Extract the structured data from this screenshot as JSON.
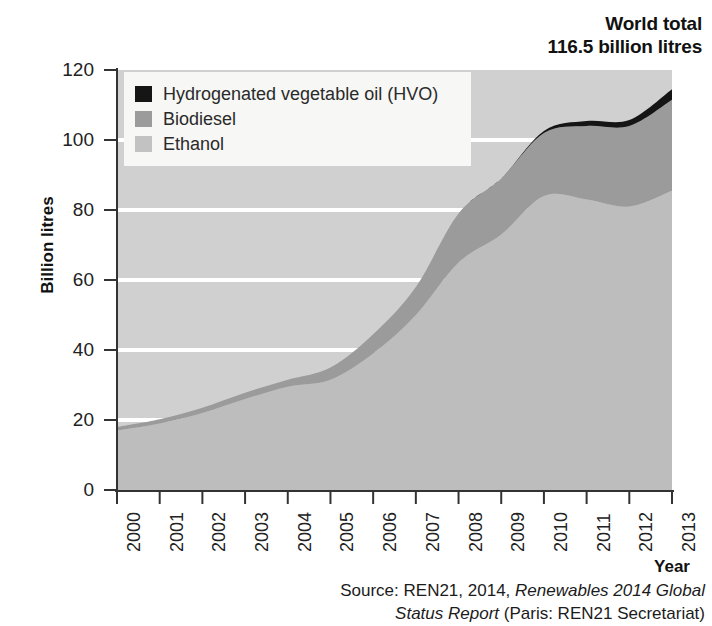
{
  "headline": {
    "line1": "World total",
    "line2": "116.5 billion litres"
  },
  "axes": {
    "y_title": "Billion litres",
    "x_title": "Year",
    "y_ticks": [
      "0",
      "20",
      "40",
      "60",
      "80",
      "100",
      "120"
    ],
    "x_ticks": [
      "2000",
      "2001",
      "2002",
      "2003",
      "2004",
      "2005",
      "2006",
      "2007",
      "2008",
      "2009",
      "2010",
      "2011",
      "2012",
      "2013"
    ]
  },
  "legend": {
    "entries": [
      {
        "label": "Hydrogenated vegetable oil (HVO)",
        "color": "#151515"
      },
      {
        "label": "Biodiesel",
        "color": "#9b9b9b"
      },
      {
        "label": "Ethanol",
        "color": "#c2c2c2"
      }
    ]
  },
  "source": {
    "prefix": "Source: REN21, 2014, ",
    "italic1": "Renewables 2014 Global",
    "italic2": "Status Report",
    "suffix": " (Paris: REN21 Secretariat)"
  },
  "colors": {
    "ethanol": "#bdbdbd",
    "biodiesel": "#9b9b9b",
    "hvo": "#151515",
    "plot_background": "#d0d0d0",
    "gridline": "#ffffff",
    "axis": "#333333"
  },
  "chart_data": {
    "type": "area",
    "stacked": true,
    "title": "World total 116.5 billion litres",
    "xlabel": "Year",
    "ylabel": "Billion litres",
    "ylim": [
      0,
      120
    ],
    "grid": true,
    "legend_position": "inside-top-left",
    "x": [
      "2000",
      "2001",
      "2002",
      "2003",
      "2004",
      "2005",
      "2006",
      "2007",
      "2008",
      "2009",
      "2010",
      "2011",
      "2012",
      "2013"
    ],
    "categories": [
      "2000",
      "2001",
      "2002",
      "2003",
      "2004",
      "2005",
      "2006",
      "2007",
      "2008",
      "2009",
      "2010",
      "2011",
      "2012",
      "2013"
    ],
    "series": [
      {
        "name": "Ethanol",
        "color": "#bdbdbd",
        "values": [
          17.0,
          19.0,
          22.0,
          26.0,
          29.5,
          31.5,
          39.0,
          50.0,
          65.0,
          73.0,
          84.0,
          83.0,
          81.0,
          85.5
        ]
      },
      {
        "name": "Biodiesel",
        "color": "#9b9b9b",
        "values": [
          1.0,
          1.2,
          1.5,
          1.8,
          2.0,
          3.5,
          5.5,
          8.0,
          14.0,
          16.0,
          18.0,
          21.0,
          23.0,
          26.0
        ]
      },
      {
        "name": "Hydrogenated vegetable oil (HVO)",
        "color": "#151515",
        "values": [
          0,
          0,
          0,
          0,
          0,
          0,
          0,
          0,
          0,
          0,
          0.6,
          1.4,
          1.7,
          3.0
        ]
      }
    ],
    "cumulative_totals": [
      18.0,
      20.2,
      23.5,
      27.8,
      31.5,
      35.0,
      44.5,
      58.0,
      79.0,
      89.0,
      102.6,
      105.4,
      105.7,
      114.5
    ],
    "annotation": "World total 116.5 billion litres"
  }
}
